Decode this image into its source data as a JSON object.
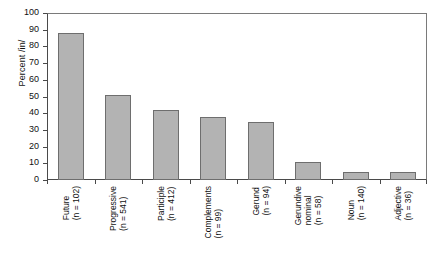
{
  "chart_data": {
    "type": "bar",
    "title": "",
    "xlabel": "",
    "ylabel": "Percent /in/",
    "ylim": [
      0,
      100
    ],
    "yticks": [
      0,
      10,
      20,
      30,
      40,
      50,
      60,
      70,
      80,
      90,
      100
    ],
    "grid": false,
    "legend": null,
    "categories": [
      "Future",
      "Progressive",
      "Participle",
      "Complements",
      "Gerund",
      "Gerundive nominal",
      "Noun",
      "Adjective"
    ],
    "category_labels": [
      {
        "name": "Future",
        "lines": [
          "Future",
          "(n = 102)"
        ],
        "n": 102
      },
      {
        "name": "Progressive",
        "lines": [
          "Progressive",
          "(n = 541)"
        ],
        "n": 541
      },
      {
        "name": "Participle",
        "lines": [
          "Participle",
          "(n = 412)"
        ],
        "n": 412
      },
      {
        "name": "Complements",
        "lines": [
          "Complements",
          "(n = 99)"
        ],
        "n": 99
      },
      {
        "name": "Gerund",
        "lines": [
          "Gerund",
          "(n = 94)"
        ],
        "n": 94
      },
      {
        "name": "Gerundive nominal",
        "lines": [
          "Gerundive",
          "nominal",
          "(n = 58)"
        ],
        "n": 58
      },
      {
        "name": "Noun",
        "lines": [
          "Noun",
          "(n = 140)"
        ],
        "n": 140
      },
      {
        "name": "Adjective",
        "lines": [
          "Adjective",
          "(n = 36)"
        ],
        "n": 36
      }
    ],
    "values": [
      88,
      51,
      42,
      38,
      35,
      11,
      5,
      5
    ],
    "bar_color": "#b3b3b3",
    "bar_border_color": "#6e6e6e",
    "axis_color": "#4a4a4a"
  }
}
